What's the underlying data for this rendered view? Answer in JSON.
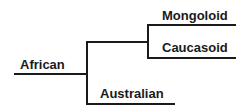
{
  "diagram": {
    "type": "phylogenetic-tree",
    "leaves": [
      {
        "id": "mongoloid",
        "label": "Mongoloid"
      },
      {
        "id": "caucasoid",
        "label": "Caucasoid"
      },
      {
        "id": "australian",
        "label": "Australian"
      }
    ],
    "root": {
      "label": "African"
    },
    "structure": "(African, ((Mongoloid, Caucasoid), Australian))",
    "colors": {
      "line": "#1a1a1a",
      "background": "#ffffff"
    }
  }
}
